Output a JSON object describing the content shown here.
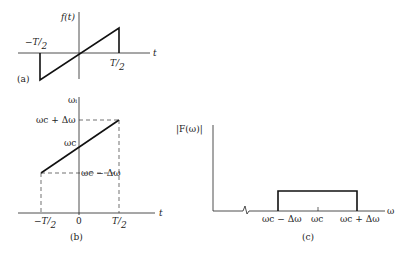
{
  "panel_a": {
    "tag": "(a)",
    "ylabel": "f(t)",
    "xlabel": "t",
    "neg_half": "−T/2",
    "pos_half": "T/2",
    "neg_T": "T",
    "neg_2": "2",
    "pos_T": "T",
    "pos_2": "2"
  },
  "panel_b": {
    "tag": "(b)",
    "ylabel": "ωᵢ",
    "xlabel": "t",
    "top": "ω_c + Δω",
    "top_text": "ωc + Δω",
    "mid_text": "ωc",
    "bot_text": "ωc − Δω",
    "zero": "0",
    "neg_T": "−T",
    "pos_T": "T",
    "two": "2"
  },
  "panel_c": {
    "tag": "(c)",
    "ylabel": "|F(ω)|",
    "xlabel": "ω",
    "left": "ωc − Δω",
    "center": "ωc",
    "right": "ωc + Δω"
  },
  "colors": {
    "line": "#1a1a1a",
    "dash": "#333333"
  }
}
